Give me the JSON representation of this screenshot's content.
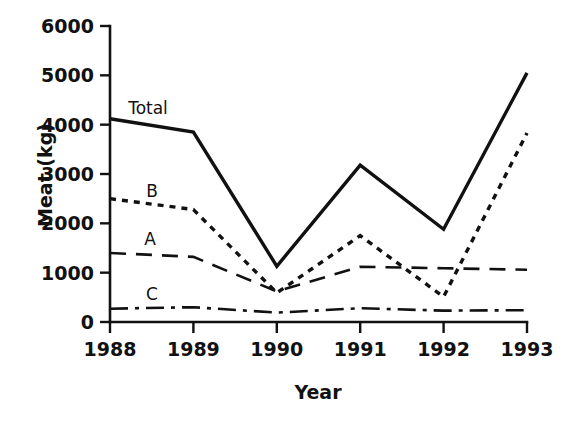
{
  "chart_data": {
    "type": "line",
    "title": "",
    "xlabel": "Year",
    "ylabel": "Meat (kg)",
    "x": [
      1988,
      1989,
      1990,
      1991,
      1992,
      1993
    ],
    "xtick_labels": [
      "1988",
      "1989",
      "1990",
      "1991",
      "1992",
      "1993"
    ],
    "ytick_labels": [
      "0",
      "1000",
      "2000",
      "3000",
      "4000",
      "5000",
      "6000"
    ],
    "ytick_values": [
      0,
      1000,
      2000,
      3000,
      4000,
      5000,
      6000
    ],
    "xlim": [
      1988,
      1993
    ],
    "ylim": [
      0,
      6000
    ],
    "grid": false,
    "legend": "inline-labels",
    "series": [
      {
        "name": "Total",
        "label": "Total",
        "style": "solid",
        "width": 3.4,
        "color": "#111111",
        "values": [
          4120,
          3850,
          1130,
          3180,
          1880,
          5050
        ]
      },
      {
        "name": "B",
        "label": "B",
        "style": "dotted",
        "width": 3.4,
        "color": "#111111",
        "values": [
          2500,
          2280,
          590,
          1750,
          510,
          3830
        ]
      },
      {
        "name": "A",
        "label": "A",
        "style": "dashed",
        "width": 2.6,
        "color": "#111111",
        "values": [
          1400,
          1320,
          620,
          1120,
          1090,
          1060
        ]
      },
      {
        "name": "C",
        "label": "C",
        "style": "dash-dot",
        "width": 2.6,
        "color": "#111111",
        "values": [
          270,
          300,
          190,
          280,
          230,
          240
        ]
      }
    ],
    "series_label_positions": [
      {
        "name": "Total",
        "x": 148,
        "y": 114
      },
      {
        "name": "B",
        "x": 152,
        "y": 197
      },
      {
        "name": "A",
        "x": 150,
        "y": 245
      },
      {
        "name": "C",
        "x": 152,
        "y": 300
      }
    ]
  },
  "axes": {
    "y_axis_title": "Meat (kg)",
    "x_axis_title": "Year"
  }
}
